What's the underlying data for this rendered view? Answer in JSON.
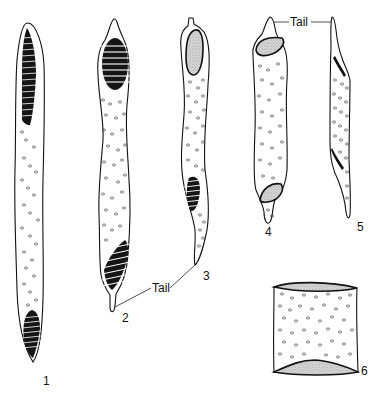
{
  "plate": {
    "background": "#ffffff",
    "ink_color": "#111111",
    "figures": [
      {
        "id": "1",
        "label": "1",
        "description": "elongate cell with striated bands at both ends"
      },
      {
        "id": "2",
        "label": "2",
        "description": "cell with striated bands at both ends and basal tail"
      },
      {
        "id": "3",
        "label": "3",
        "description": "cell with stippled apical body, striated band, tapering tail"
      },
      {
        "id": "4",
        "label": "4",
        "description": "cell with two stippled bodies and short tail, face view"
      },
      {
        "id": "5",
        "label": "5",
        "description": "same cell in side view"
      },
      {
        "id": "6",
        "label": "6",
        "description": "cylindrical fragment with granules"
      }
    ],
    "annotations": {
      "tail_lower": "Tail",
      "tail_upper": "Tail"
    }
  }
}
